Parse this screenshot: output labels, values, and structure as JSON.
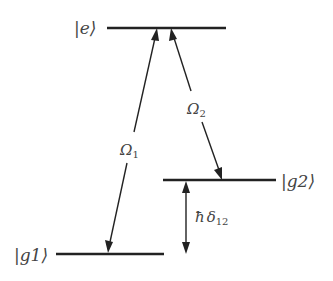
{
  "diagram": {
    "type": "lambda-three-level-system",
    "levels": [
      {
        "id": "e",
        "label": "|e⟩"
      },
      {
        "id": "g1",
        "label": "|g1⟩"
      },
      {
        "id": "g2",
        "label": "|g2⟩"
      }
    ],
    "transitions": [
      {
        "id": "omega1",
        "from": "g1",
        "to": "e",
        "symbol": "Ω",
        "subscript": "1",
        "direction": "bidirectional"
      },
      {
        "id": "omega2",
        "from": "e",
        "to": "g2",
        "symbol": "Ω",
        "subscript": "2",
        "direction": "bidirectional"
      }
    ],
    "detuning": {
      "id": "delta12",
      "between": [
        "g1",
        "g2"
      ],
      "prefix": "ħ",
      "symbol": "δ",
      "subscript": "12"
    },
    "colors": {
      "line": "#222222",
      "text": "#444444",
      "background": "#ffffff"
    }
  }
}
